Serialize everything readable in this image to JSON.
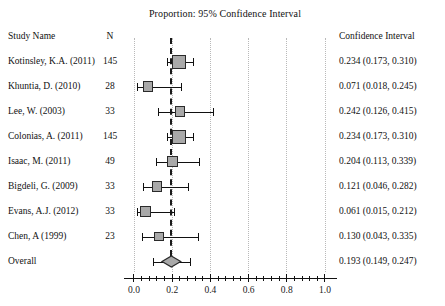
{
  "chart_data": {
    "type": "forest",
    "title": "Proportion: 95% Confidence Interval",
    "xlabel": "",
    "ylabel": "",
    "xlim": [
      0.0,
      1.0
    ],
    "grid": true,
    "legend": "none",
    "reference_line": 0.193,
    "x_ticks_major": [
      "0.0",
      "0.2",
      "0.4",
      "0.6",
      "0.8",
      "1.0"
    ],
    "x_ticks_major_values": [
      0.0,
      0.2,
      0.4,
      0.6,
      0.8,
      1.0
    ],
    "x_minor_tick_step": 0.04,
    "columns": {
      "study": "Study Name",
      "n": "N",
      "ci": "Confidence Interval"
    },
    "rows": [
      {
        "study": "Kotinsley, K.A. (2011)",
        "n": "145",
        "ci_text": "0.234 (0.173, 0.310)",
        "estimate": 0.234,
        "lower": 0.173,
        "upper": 0.31,
        "weight": 145
      },
      {
        "study": "Khuntia, D. (2010)",
        "n": "28",
        "ci_text": "0.071 (0.018, 0.245)",
        "estimate": 0.071,
        "lower": 0.018,
        "upper": 0.245,
        "weight": 28
      },
      {
        "study": "Lee, W. (2003)",
        "n": "33",
        "ci_text": "0.242 (0.126, 0.415)",
        "estimate": 0.242,
        "lower": 0.126,
        "upper": 0.415,
        "weight": 33
      },
      {
        "study": "Colonias, A. (2011)",
        "n": "145",
        "ci_text": "0.234 (0.173, 0.310)",
        "estimate": 0.234,
        "lower": 0.173,
        "upper": 0.31,
        "weight": 145
      },
      {
        "study": "Isaac, M. (2011)",
        "n": "49",
        "ci_text": "0.204 (0.113, 0.339)",
        "estimate": 0.204,
        "lower": 0.113,
        "upper": 0.339,
        "weight": 49
      },
      {
        "study": "Bigdeli, G. (2009)",
        "n": "33",
        "ci_text": "0.121 (0.046, 0.282)",
        "estimate": 0.121,
        "lower": 0.046,
        "upper": 0.282,
        "weight": 33
      },
      {
        "study": "Evans, A.J. (2012)",
        "n": "33",
        "ci_text": "0.061 (0.015, 0.212)",
        "estimate": 0.061,
        "lower": 0.015,
        "upper": 0.212,
        "weight": 33
      },
      {
        "study": "Chen, A (1999)",
        "n": "23",
        "ci_text": "0.130 (0.043, 0.335)",
        "estimate": 0.13,
        "lower": 0.043,
        "upper": 0.335,
        "weight": 23
      }
    ],
    "overall": {
      "study": "Overall",
      "n": "",
      "ci_text": "0.193 (0.149, 0.247)",
      "estimate": 0.193,
      "lower": 0.149,
      "upper": 0.247
    },
    "colors": {
      "marker_fill": "#a9a9a9",
      "marker_edge": "#2a2a2a",
      "line": "#111111",
      "grid": "#b9b9b9",
      "reference": "#1a1a1a",
      "text": "#111111",
      "background": "#ffffff"
    }
  }
}
